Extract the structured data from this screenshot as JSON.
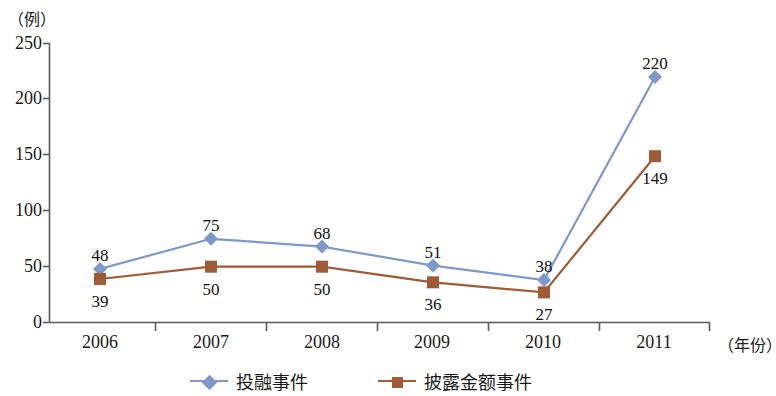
{
  "chart_data": {
    "type": "line",
    "title": "",
    "xlabel": "（年份）",
    "ylabel": "（例）",
    "categories": [
      "2006",
      "2007",
      "2008",
      "2009",
      "2010",
      "2011"
    ],
    "series": [
      {
        "name": "投融事件",
        "color": "#7d99c9",
        "marker": "diamond",
        "values": [
          48,
          75,
          68,
          51,
          38,
          220
        ],
        "labels": [
          "48",
          "75",
          "68",
          "51",
          "38",
          "220"
        ]
      },
      {
        "name": "披露金额事件",
        "color": "#a05a35",
        "marker": "square",
        "values": [
          39,
          50,
          50,
          36,
          27,
          149
        ],
        "labels": [
          "39",
          "50",
          "50",
          "36",
          "27",
          "149"
        ]
      }
    ],
    "ylim": [
      0,
      250
    ],
    "yticks": [
      0,
      50,
      100,
      150,
      200,
      250
    ],
    "ytick_labels": [
      "0",
      "50",
      "100",
      "150",
      "200",
      "250"
    ],
    "grid": false,
    "legend_position": "bottom"
  },
  "axis": {
    "y_unit": "（例）",
    "x_unit": "（年份）"
  },
  "legend": {
    "items": [
      {
        "label": "投融事件"
      },
      {
        "label": "披露金额事件"
      }
    ]
  }
}
